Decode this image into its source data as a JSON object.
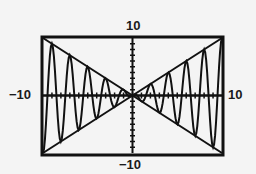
{
  "chart_data": {
    "type": "line",
    "title": "",
    "xlabel": "",
    "ylabel": "",
    "window": {
      "xmin": -10,
      "xmax": 10,
      "ymin": -10,
      "ymax": 10,
      "xscl": 1,
      "yscl": 1
    },
    "xlim": [
      -10,
      10
    ],
    "ylim": [
      -10,
      10
    ],
    "grid": false,
    "legend": null,
    "tick_labels": {
      "top": "10",
      "bottom": "-10",
      "left": "-10",
      "right": "10"
    },
    "series": [
      {
        "name": "y = x",
        "expr": "x",
        "style": "solid"
      },
      {
        "name": "y = -x",
        "expr": "-x",
        "style": "solid"
      },
      {
        "name": "y = x cos(pi x)",
        "expr": "x*cos(pi*x)",
        "style": "solid",
        "peaks_x": [
          -9,
          -7,
          -5,
          -3,
          -1,
          2,
          4,
          6,
          8,
          10
        ]
      }
    ]
  },
  "labels": {
    "top": "10",
    "bottom": "−10",
    "left": "−10",
    "right": "10"
  },
  "colors": {
    "background": "#f4f4f4",
    "ink": "#111111"
  }
}
